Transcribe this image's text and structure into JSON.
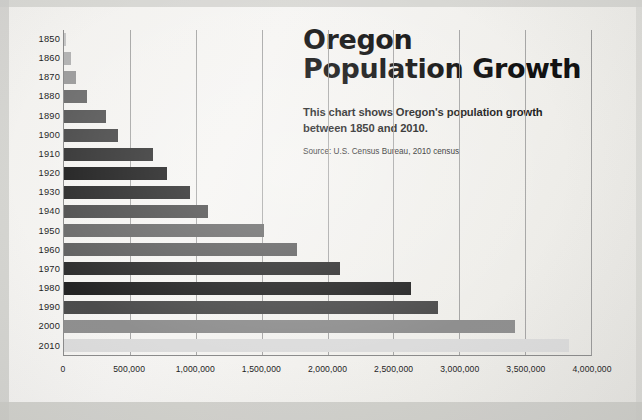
{
  "headline": {
    "title_line1": "Oregon",
    "title_line2": "Population Growth",
    "subtitle": "This chart shows Oregon's population growth between 1850 and 2010.",
    "source": "Source: U.S. Census Bureau, 2010 census"
  },
  "colors": {
    "page_background": "#f2f1ee",
    "text": "#111111",
    "gridline": "#9a9a9a",
    "axis": "#8b8b8b"
  },
  "chart_data": {
    "type": "bar",
    "orientation": "horizontal",
    "title": "Oregon Population Growth",
    "subtitle": "This chart shows Oregon's population growth between 1850 and 2010.",
    "source": "Source: U.S. Census Bureau, 2010 census",
    "xlabel": "",
    "ylabel": "",
    "xlim": [
      0,
      4000000
    ],
    "xticks": [
      0,
      500000,
      1000000,
      1500000,
      2000000,
      2500000,
      3000000,
      3500000,
      4000000
    ],
    "xtick_labels": [
      "0",
      "500,000",
      "1,000,000",
      "1,500,000",
      "2,000,000",
      "2,500,000",
      "3,000,000",
      "3,500,000",
      "4,000,000"
    ],
    "grid": true,
    "legend": false,
    "categories": [
      "1850",
      "1860",
      "1870",
      "1880",
      "1890",
      "1900",
      "1910",
      "1920",
      "1930",
      "1940",
      "1950",
      "1960",
      "1970",
      "1980",
      "1990",
      "2000",
      "2010"
    ],
    "values": [
      12093,
      52465,
      90923,
      174768,
      317704,
      413536,
      672765,
      783389,
      953786,
      1089684,
      1521341,
      1768687,
      2091385,
      2633105,
      2842321,
      3421399,
      3831074
    ],
    "bar_colors": [
      "#c6c6c6",
      "#b3b3b3",
      "#9c9c9c",
      "#6d6d6d",
      "#585858",
      "#4a4a4a",
      "#343434",
      "#1f1f1f",
      "#2b2b2b",
      "#4f4f4f",
      "#6a6a6a",
      "#606060",
      "#2e2e2e",
      "#242424",
      "#4c4c4c",
      "#8f8f8f",
      "#dcdcdc"
    ]
  }
}
